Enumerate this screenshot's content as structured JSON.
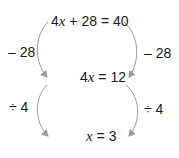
{
  "diagram": {
    "steps": [
      {
        "coef": "4",
        "var": "x",
        "rest": " + 28 = 40"
      },
      {
        "coef": "4",
        "var": "x",
        "rest": " = 12"
      },
      {
        "coef": "",
        "var": "x",
        "rest": " = 3"
      }
    ],
    "operations": [
      {
        "label": "– 28"
      },
      {
        "label": "÷ 4"
      }
    ],
    "arrow_color": "#9a9a9a"
  }
}
